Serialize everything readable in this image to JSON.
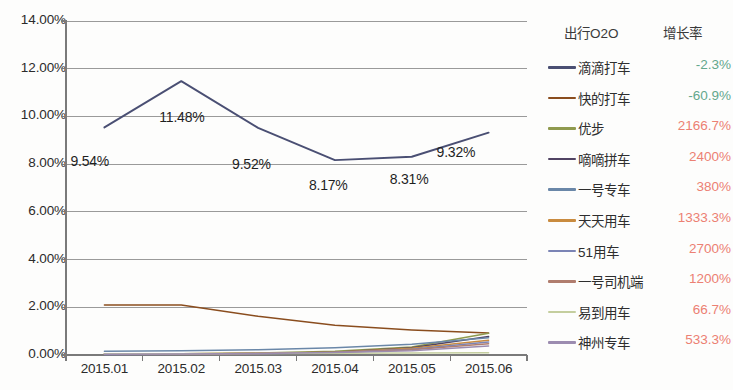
{
  "chart_data": {
    "type": "line",
    "title": "",
    "xlabel": "",
    "ylabel": "",
    "categories": [
      "2015.01",
      "2015.02",
      "2015.03",
      "2015.04",
      "2015.05",
      "2015.06"
    ],
    "ylim": [
      0,
      14
    ],
    "ytick_labels": [
      "14.00%",
      "12.00%",
      "10.00%",
      "8.00%",
      "6.00%",
      "4.00%",
      "2.00%",
      "0.00%"
    ],
    "ytick_values": [
      14,
      12,
      10,
      8,
      6,
      4,
      2,
      0
    ],
    "grid": true,
    "legend_position": "right",
    "data_labels": [
      {
        "text": "9.54%",
        "x": 0
      },
      {
        "text": "11.48%",
        "x": 1
      },
      {
        "text": "9.52%",
        "x": 2
      },
      {
        "text": "8.17%",
        "x": 3
      },
      {
        "text": "8.31%",
        "x": 4
      },
      {
        "text": "9.32%",
        "x": 5
      }
    ],
    "series": [
      {
        "name": "滴滴打车",
        "growth": "-2.3%",
        "growth_sign": "neg",
        "color": "#4a4f73",
        "values": [
          9.54,
          11.48,
          9.52,
          8.17,
          8.31,
          9.32
        ]
      },
      {
        "name": "快的打车",
        "growth": "-60.9%",
        "growth_sign": "neg",
        "color": "#8a4d1e",
        "values": [
          2.1,
          2.1,
          1.62,
          1.25,
          1.05,
          0.92
        ]
      },
      {
        "name": "优步",
        "growth": "2166.7%",
        "growth_sign": "pos",
        "color": "#8f9a4e",
        "values": [
          0.04,
          0.05,
          0.08,
          0.16,
          0.34,
          0.91
        ]
      },
      {
        "name": "嘀嘀拼车",
        "growth": "2400%",
        "growth_sign": "pos",
        "color": "#504363",
        "values": [
          0.03,
          0.04,
          0.06,
          0.12,
          0.3,
          0.78
        ]
      },
      {
        "name": "一号专车",
        "growth": "380%",
        "growth_sign": "pos",
        "color": "#6a87a8",
        "values": [
          0.16,
          0.18,
          0.22,
          0.3,
          0.45,
          0.72
        ]
      },
      {
        "name": "天天用车",
        "growth": "1333.3%",
        "growth_sign": "pos",
        "color": "#c98b3f",
        "values": [
          0.04,
          0.05,
          0.07,
          0.12,
          0.28,
          0.62
        ]
      },
      {
        "name": "51用车",
        "growth": "2700%",
        "growth_sign": "pos",
        "color": "#7b84b5",
        "values": [
          0.02,
          0.03,
          0.05,
          0.1,
          0.24,
          0.55
        ]
      },
      {
        "name": "一号司机端",
        "growth": "1200%",
        "growth_sign": "pos",
        "color": "#b07d6e",
        "values": [
          0.03,
          0.04,
          0.06,
          0.11,
          0.22,
          0.47
        ]
      },
      {
        "name": "易到用车",
        "growth": "66.7%",
        "growth_sign": "pos",
        "color": "#c4ce9e",
        "values": [
          0.05,
          0.05,
          0.06,
          0.07,
          0.08,
          0.09
        ]
      },
      {
        "name": "神州专车",
        "growth": "533.3%",
        "growth_sign": "pos",
        "color": "#9c8cb0",
        "values": [
          0.03,
          0.04,
          0.06,
          0.1,
          0.18,
          0.38
        ]
      }
    ]
  },
  "legend": {
    "header_name": "出行O2O",
    "header_rate": "增长率"
  },
  "colors": {
    "positive": "#ec8073",
    "negative": "#63a88c",
    "grid": "#9a9a9a",
    "axis": "#7a7a7a",
    "primary_line": "#4a4f73"
  }
}
